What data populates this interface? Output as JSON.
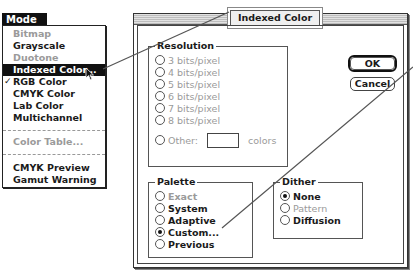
{
  "menu": {
    "title": "Mode",
    "items": [
      {
        "label": "Bitmap",
        "disabled": true
      },
      {
        "label": "Grayscale",
        "disabled": false
      },
      {
        "label": "Duotone",
        "disabled": true
      },
      {
        "label": "Indexed Color...",
        "highlighted": true
      },
      {
        "label": "RGB Color",
        "checked": true,
        "check_glyph": "✓"
      },
      {
        "label": "CMYK Color"
      },
      {
        "label": "Lab Color"
      },
      {
        "label": "Multichannel"
      },
      {
        "label": "Color Table...",
        "disabled": true
      },
      {
        "label": "CMYK Preview"
      },
      {
        "label": "Gamut Warning"
      }
    ]
  },
  "dialog": {
    "title": "Indexed Color",
    "buttons": {
      "ok": "OK",
      "cancel": "Cancel"
    },
    "resolution": {
      "label": "Resolution",
      "options": [
        {
          "label": "3 bits/pixel",
          "selected": false,
          "disabled": true
        },
        {
          "label": "4 bits/pixel",
          "selected": false,
          "disabled": true
        },
        {
          "label": "5 bits/pixel",
          "selected": false,
          "disabled": true
        },
        {
          "label": "6 bits/pixel",
          "selected": false,
          "disabled": true
        },
        {
          "label": "7 bits/pixel",
          "selected": false,
          "disabled": true
        },
        {
          "label": "8 bits/pixel",
          "selected": false,
          "disabled": true
        }
      ],
      "other_label": "Other:",
      "other_value": "",
      "other_suffix": "colors"
    },
    "palette": {
      "label": "Palette",
      "options": [
        {
          "label": "Exact",
          "selected": false,
          "disabled": true
        },
        {
          "label": "System",
          "selected": false
        },
        {
          "label": "Adaptive",
          "selected": false
        },
        {
          "label": "Custom...",
          "selected": true
        },
        {
          "label": "Previous",
          "selected": false
        }
      ]
    },
    "dither": {
      "label": "Dither",
      "options": [
        {
          "label": "None",
          "selected": true
        },
        {
          "label": "Pattern",
          "selected": false,
          "disabled": true
        },
        {
          "label": "Diffusion",
          "selected": false
        }
      ]
    }
  }
}
